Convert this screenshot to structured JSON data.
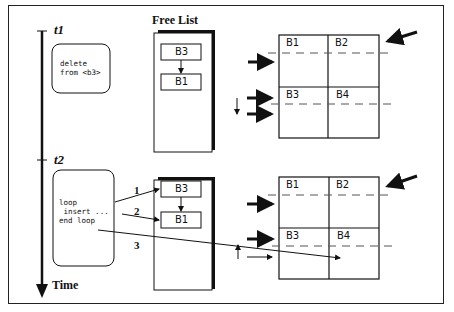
{
  "timeline": {
    "t1_label": "t1",
    "t2_label": "t2",
    "axis_label": "Time"
  },
  "free_list": {
    "title": "Free List",
    "top_list": [
      "B3",
      "B1"
    ],
    "bottom_list": [
      "B3",
      "B1"
    ]
  },
  "code_boxes": {
    "top": "delete\nfrom <b3>",
    "bottom": "loop\n insert ...\nend loop"
  },
  "step_labels": [
    "1",
    "2",
    "3"
  ],
  "grids": {
    "top": [
      "B1",
      "B2",
      "B3",
      "B4"
    ],
    "bottom": [
      "B1",
      "B2",
      "B3",
      "B4"
    ]
  },
  "colors": {
    "line": "#111111",
    "dash": "#555555",
    "background": "#ffffff"
  }
}
